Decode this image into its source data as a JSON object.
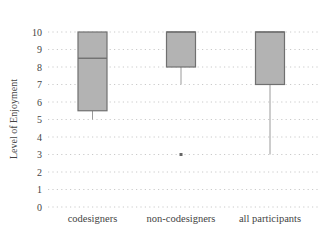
{
  "chart_data": {
    "type": "boxplot",
    "title": "",
    "xlabel": "",
    "ylabel": "Level of Enjoyment",
    "ylim": [
      0,
      10
    ],
    "yticks": [
      0,
      1,
      2,
      3,
      4,
      5,
      6,
      7,
      8,
      9,
      10
    ],
    "grid": "horizontal-dotted",
    "categories": [
      "codesigners",
      "non-codesigners",
      "all participants"
    ],
    "series": [
      {
        "name": "codesigners",
        "whisker_low": 5,
        "q1": 5.5,
        "median": 8.5,
        "q3": 10,
        "whisker_high": 10,
        "outliers": []
      },
      {
        "name": "non-codesigners",
        "whisker_low": 7,
        "q1": 8,
        "median": 10,
        "q3": 10,
        "whisker_high": 10,
        "outliers": [
          3
        ]
      },
      {
        "name": "all participants",
        "whisker_low": 3,
        "q1": 7,
        "median": 10,
        "q3": 10,
        "whisker_high": 10,
        "outliers": []
      }
    ],
    "colors": {
      "box_fill": "#b3b3b3",
      "box_stroke": "#707070",
      "grid": "#bdbdbd",
      "whisker": "#9a9a9a"
    }
  }
}
